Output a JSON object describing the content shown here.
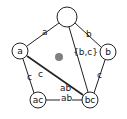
{
  "diagram": {
    "nodes": [
      {
        "id": "top",
        "label": "",
        "cx": 67,
        "cy": 17,
        "r": 10
      },
      {
        "id": "a",
        "label": "a",
        "cx": 20,
        "cy": 51,
        "r": 8
      },
      {
        "id": "b",
        "label": "b",
        "cx": 108,
        "cy": 52,
        "r": 8
      },
      {
        "id": "ac",
        "label": "ac",
        "cx": 38,
        "cy": 100,
        "r": 8
      },
      {
        "id": "bc",
        "label": "bc",
        "cx": 90,
        "cy": 100,
        "r": 8
      }
    ],
    "edges": [
      {
        "from": "top",
        "to": "a",
        "label": "a"
      },
      {
        "from": "top",
        "to": "b",
        "label": "b"
      },
      {
        "from": "top",
        "to": "bc",
        "label": "{b,c}"
      },
      {
        "from": "a",
        "to": "ac",
        "label": "c"
      },
      {
        "from": "a",
        "to": "bc",
        "label_1": "c",
        "label_2": "ab"
      },
      {
        "from": "b",
        "to": "bc",
        "label": "c"
      },
      {
        "from": "ac",
        "to": "bc",
        "label": "ab"
      }
    ],
    "center_dot": {
      "cx": 59,
      "cy": 57,
      "r": 4,
      "color": "#808080"
    },
    "colors": {
      "stroke": "#222222",
      "fill": "#ffffff"
    }
  }
}
